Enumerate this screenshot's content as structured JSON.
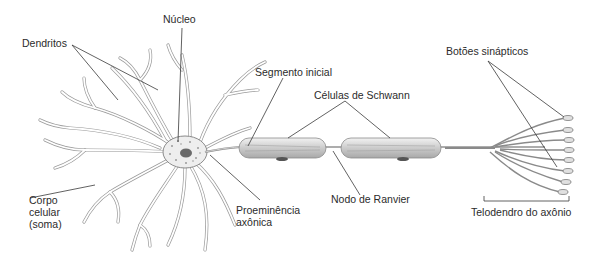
{
  "diagram": {
    "background": "#ffffff",
    "colors": {
      "outline": "#7d7d7d",
      "schwann_fill": "#d9d9d9",
      "leader": "#3a3a3a",
      "text": "#2b2b2b"
    },
    "labels": {
      "nucleo": "Núcleo",
      "dendritos": "Dendritos",
      "segmento_inicial": "Segmento inicial",
      "celulas_schwann": "Células de Schwann",
      "botoes_sinapticos": "Botões sinápticos",
      "corpo_celular_1": "Corpo",
      "corpo_celular_2": "celular",
      "corpo_celular_3": "(soma)",
      "proeminencia_1": "Proeminência",
      "proeminencia_2": "axônica",
      "nodo_ranvier": "Nodo de Ranvier",
      "telodendro": "Telodendro do axônio"
    },
    "parts": [
      "dendrites",
      "cell-body",
      "nucleus",
      "axon-hillock",
      "initial-segment",
      "schwann-cell",
      "node-of-ranvier",
      "schwann-cell",
      "axon-telodendria",
      "synaptic-terminals"
    ]
  }
}
